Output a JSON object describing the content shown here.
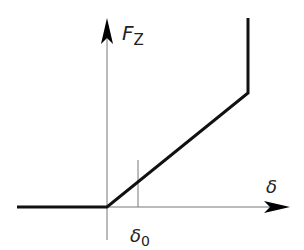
{
  "diagram": {
    "y_axis_label": "F",
    "y_axis_subscript": "Z",
    "x_axis_label": "δ",
    "tick_label": "δ",
    "tick_subscript": "0",
    "colors": {
      "axis": "#777777",
      "curve": "#111111",
      "background": "#ffffff"
    }
  }
}
